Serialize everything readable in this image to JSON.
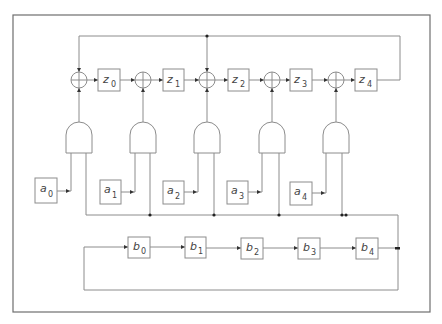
{
  "diagram": {
    "type": "circuit-schematic",
    "z_registers": [
      {
        "letter": "z",
        "index": "0"
      },
      {
        "letter": "z",
        "index": "1"
      },
      {
        "letter": "z",
        "index": "2"
      },
      {
        "letter": "z",
        "index": "3"
      },
      {
        "letter": "z",
        "index": "4"
      }
    ],
    "a_inputs": [
      {
        "letter": "a",
        "index": "0"
      },
      {
        "letter": "a",
        "index": "1"
      },
      {
        "letter": "a",
        "index": "2"
      },
      {
        "letter": "a",
        "index": "3"
      },
      {
        "letter": "a",
        "index": "4"
      }
    ],
    "b_registers": [
      {
        "letter": "b",
        "index": "0"
      },
      {
        "letter": "b",
        "index": "1"
      },
      {
        "letter": "b",
        "index": "2"
      },
      {
        "letter": "b",
        "index": "3"
      },
      {
        "letter": "b",
        "index": "4"
      }
    ],
    "xor_count": 5,
    "and_gate_count": 5,
    "colors": {
      "wire": "#8c8c8c",
      "frame": "#6e6e6e",
      "junction": "#222222"
    }
  }
}
